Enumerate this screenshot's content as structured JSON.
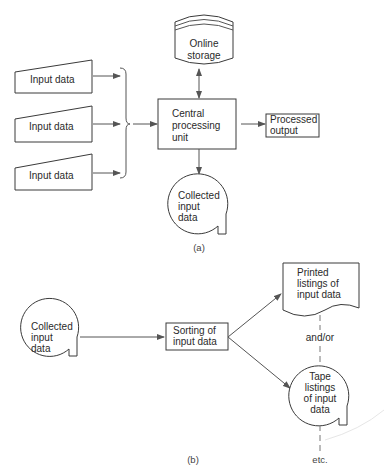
{
  "diagram_a": {
    "caption": "(a)",
    "online_storage": {
      "line1": "Online",
      "line2": "storage"
    },
    "inputs": [
      {
        "label": "Input data"
      },
      {
        "label": "Input data"
      },
      {
        "label": "Input data"
      }
    ],
    "cpu": {
      "line1": "Central",
      "line2": "processing",
      "line3": "unit"
    },
    "processed_output": {
      "line1": "Processed",
      "line2": "output"
    },
    "collected": {
      "line1": "Collected",
      "line2": "input",
      "line3": "data"
    }
  },
  "diagram_b": {
    "caption": "(b)",
    "collected": {
      "line1": "Collected",
      "line2": "input",
      "line3": "data"
    },
    "sorting": {
      "line1": "Sorting of",
      "line2": "input data"
    },
    "printed": {
      "line1": "Printed",
      "line2": "listings of",
      "line3": "input data"
    },
    "connector_label": "and/or",
    "tape": {
      "line1": "Tape",
      "line2": "listings",
      "line3": "of input",
      "line4": "data"
    },
    "trailing_label": "etc."
  },
  "colors": {
    "stroke": "#3a3a3a",
    "text": "#2a2a2a",
    "background": "#ffffff"
  }
}
